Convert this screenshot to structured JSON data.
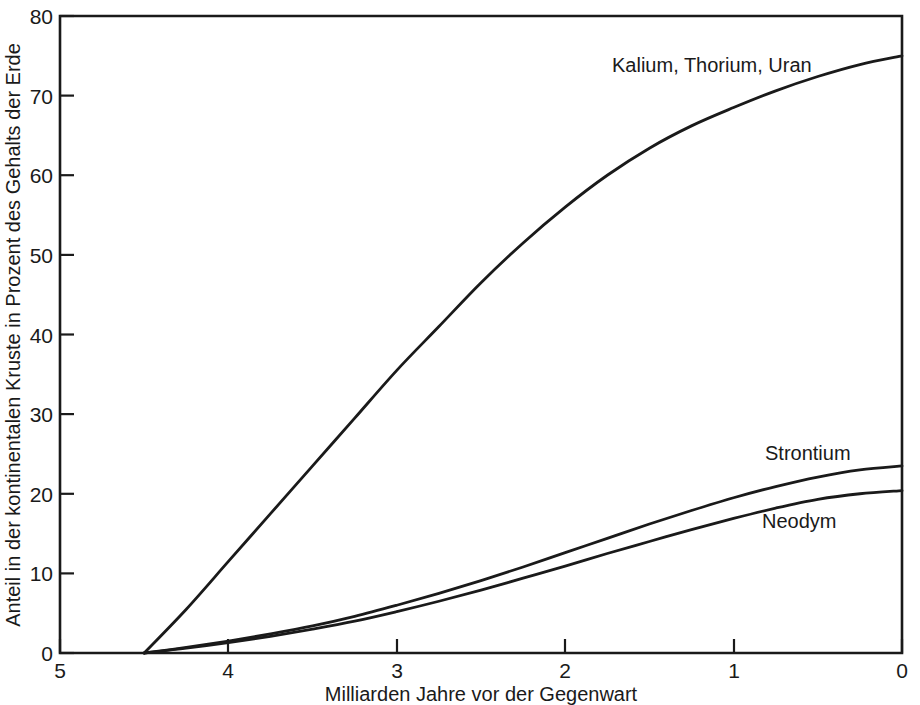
{
  "chart_data": {
    "type": "line",
    "title": "",
    "xlabel": "Milliarden Jahre vor der Gegenwart",
    "ylabel": "Anteil in der kontinentalen Kruste in Prozent des Gehalts der Erde",
    "xlim": [
      5,
      0
    ],
    "ylim": [
      0,
      80
    ],
    "x_ticks": [
      5,
      4,
      3,
      2,
      1,
      0
    ],
    "y_ticks": [
      0,
      10,
      20,
      30,
      40,
      50,
      60,
      70,
      80
    ],
    "x_tick_labels": [
      "5",
      "4",
      "3",
      "2",
      "1",
      "0"
    ],
    "y_tick_labels": [
      "0",
      "10",
      "20",
      "30",
      "40",
      "50",
      "60",
      "70",
      "80"
    ],
    "x_axis_reversed": true,
    "grid": false,
    "legend_position": "inline-labels",
    "x": [
      4.5,
      4.25,
      4.0,
      3.75,
      3.5,
      3.25,
      3.0,
      2.75,
      2.5,
      2.25,
      2.0,
      1.75,
      1.5,
      1.25,
      1.0,
      0.75,
      0.5,
      0.25,
      0.0
    ],
    "series": [
      {
        "name": "Kalium, Thorium, Uran",
        "label": "Kalium, Thorium, Uran",
        "values": [
          0,
          5.5,
          11.5,
          17.5,
          23.5,
          29.5,
          35.5,
          41.0,
          46.5,
          51.5,
          56.0,
          60.0,
          63.4,
          66.2,
          68.5,
          70.6,
          72.4,
          73.9,
          75.0
        ]
      },
      {
        "name": "Strontium",
        "label": "Strontium",
        "values": [
          0,
          0.7,
          1.5,
          2.4,
          3.4,
          4.6,
          6.0,
          7.5,
          9.1,
          10.8,
          12.6,
          14.4,
          16.2,
          17.9,
          19.5,
          20.9,
          22.1,
          23.0,
          23.5
        ]
      },
      {
        "name": "Neodym",
        "label": "Neodym",
        "values": [
          0,
          0.6,
          1.3,
          2.1,
          3.0,
          4.0,
          5.2,
          6.5,
          7.9,
          9.4,
          10.9,
          12.5,
          14.0,
          15.5,
          16.9,
          18.2,
          19.3,
          20.0,
          20.4
        ]
      }
    ],
    "annotations": [
      {
        "text": "Kalium, Thorium, Uran",
        "x": 1.68,
        "y": 74.2
      },
      {
        "text": "Strontium",
        "x": 0.88,
        "y": 26.8
      },
      {
        "text": "Neodym",
        "x": 0.82,
        "y": 17.2
      }
    ],
    "colors": {
      "curve": "#1a1a1a",
      "axis": "#1a1a1a",
      "background": "#ffffff"
    }
  }
}
